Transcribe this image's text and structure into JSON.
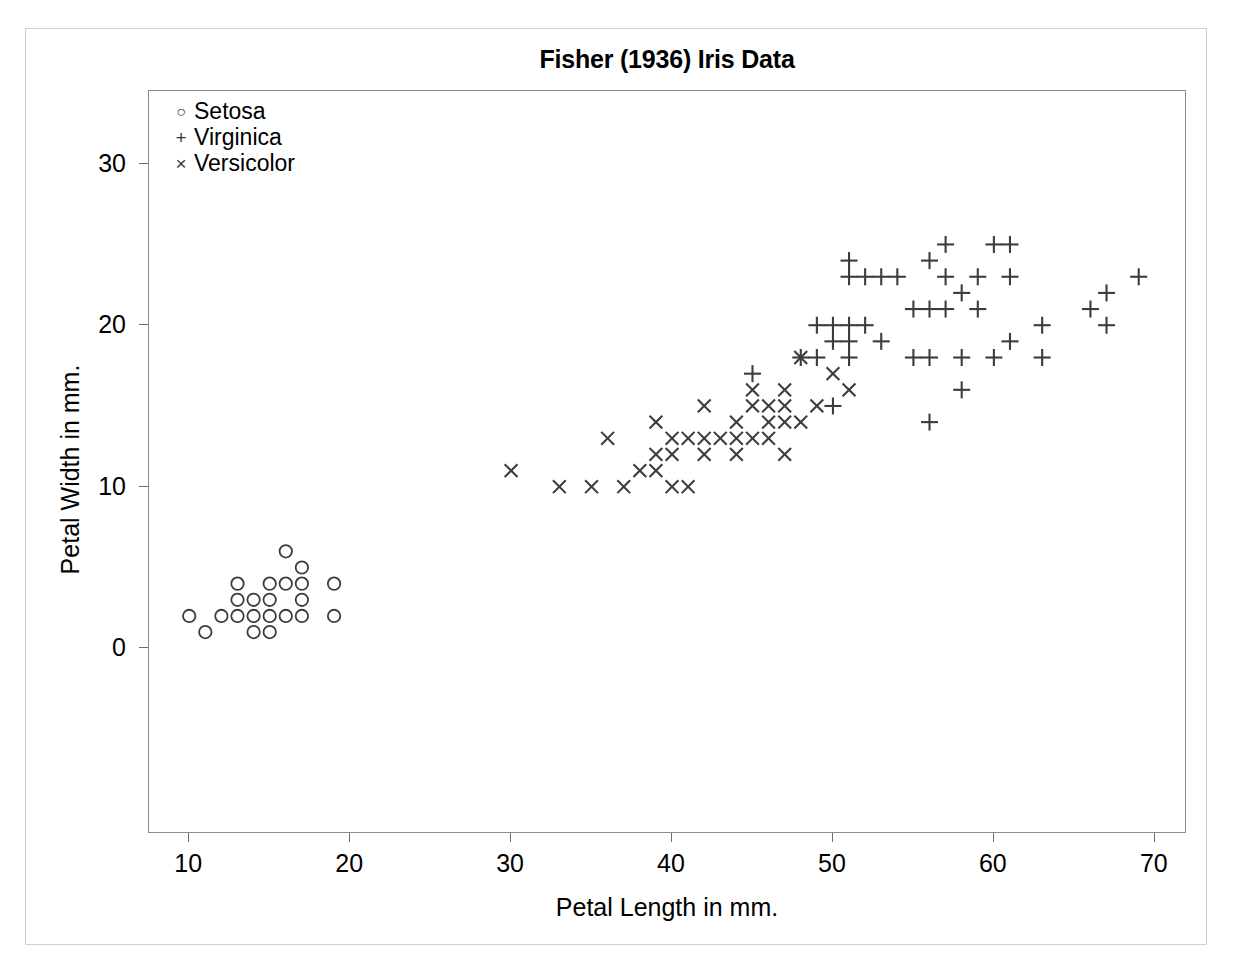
{
  "scan_header_text": "",
  "chart_title": "Fisher (1936) Iris Data",
  "axis": {
    "x_title": "Petal Length in mm.",
    "y_title": "Petal Width in mm.",
    "x_ticks": [
      10,
      20,
      30,
      40,
      50,
      60,
      70
    ],
    "y_ticks": [
      0,
      10,
      20,
      30
    ],
    "x_min": 7.5,
    "x_max": 72.0,
    "y_min": -11.5,
    "y_max": 34.5
  },
  "legend": {
    "position": "top-left",
    "entries": [
      {
        "symbol": "circle",
        "glyph": "○",
        "label": "Setosa"
      },
      {
        "symbol": "plus",
        "glyph": "+",
        "label": "Virginica"
      },
      {
        "symbol": "cross",
        "glyph": "×",
        "label": "Versicolor"
      }
    ]
  },
  "colors": {
    "marker": "#3c3c3c",
    "plot_border": "#8c8c8c",
    "outer_border": "#cfcfcf",
    "tick": "#6f6f6f",
    "text": "#000000",
    "background": "#ffffff"
  },
  "chart_data": {
    "type": "scatter",
    "title": "Fisher (1936) Iris Data",
    "xlabel": "Petal Length in mm.",
    "ylabel": "Petal Width in mm.",
    "xlim": [
      7.5,
      72.0
    ],
    "ylim": [
      -11.5,
      34.5
    ],
    "xticks": [
      10,
      20,
      30,
      40,
      50,
      60,
      70
    ],
    "yticks": [
      0,
      10,
      20,
      30
    ],
    "grid": false,
    "legend_position": "upper-left",
    "units": "millimetres",
    "series": [
      {
        "name": "Setosa",
        "marker": "circle",
        "points": [
          [
            14,
            2
          ],
          [
            14,
            2
          ],
          [
            13,
            2
          ],
          [
            15,
            2
          ],
          [
            14,
            2
          ],
          [
            17,
            4
          ],
          [
            14,
            3
          ],
          [
            15,
            2
          ],
          [
            14,
            2
          ],
          [
            15,
            1
          ],
          [
            15,
            2
          ],
          [
            16,
            2
          ],
          [
            14,
            1
          ],
          [
            11,
            1
          ],
          [
            12,
            2
          ],
          [
            15,
            4
          ],
          [
            13,
            4
          ],
          [
            14,
            3
          ],
          [
            17,
            3
          ],
          [
            15,
            3
          ],
          [
            17,
            2
          ],
          [
            15,
            4
          ],
          [
            10,
            2
          ],
          [
            17,
            5
          ],
          [
            19,
            2
          ],
          [
            16,
            2
          ],
          [
            16,
            4
          ],
          [
            15,
            2
          ],
          [
            14,
            2
          ],
          [
            16,
            2
          ],
          [
            16,
            2
          ],
          [
            15,
            4
          ],
          [
            15,
            1
          ],
          [
            14,
            2
          ],
          [
            15,
            2
          ],
          [
            12,
            2
          ],
          [
            13,
            2
          ],
          [
            14,
            1
          ],
          [
            13,
            2
          ],
          [
            15,
            2
          ],
          [
            13,
            3
          ],
          [
            13,
            3
          ],
          [
            13,
            2
          ],
          [
            16,
            6
          ],
          [
            19,
            4
          ],
          [
            14,
            3
          ],
          [
            16,
            2
          ],
          [
            14,
            2
          ],
          [
            15,
            2
          ],
          [
            14,
            2
          ]
        ]
      },
      {
        "name": "Versicolor",
        "marker": "cross",
        "points": [
          [
            47,
            14
          ],
          [
            45,
            15
          ],
          [
            49,
            15
          ],
          [
            40,
            13
          ],
          [
            46,
            15
          ],
          [
            45,
            13
          ],
          [
            47,
            16
          ],
          [
            33,
            10
          ],
          [
            46,
            13
          ],
          [
            39,
            14
          ],
          [
            35,
            10
          ],
          [
            42,
            15
          ],
          [
            40,
            10
          ],
          [
            47,
            14
          ],
          [
            36,
            13
          ],
          [
            44,
            14
          ],
          [
            45,
            15
          ],
          [
            41,
            10
          ],
          [
            45,
            15
          ],
          [
            39,
            11
          ],
          [
            48,
            18
          ],
          [
            40,
            13
          ],
          [
            49,
            15
          ],
          [
            47,
            12
          ],
          [
            43,
            13
          ],
          [
            44,
            14
          ],
          [
            48,
            14
          ],
          [
            50,
            17
          ],
          [
            45,
            15
          ],
          [
            35,
            10
          ],
          [
            38,
            11
          ],
          [
            37,
            10
          ],
          [
            39,
            12
          ],
          [
            51,
            16
          ],
          [
            45,
            15
          ],
          [
            45,
            16
          ],
          [
            47,
            15
          ],
          [
            44,
            13
          ],
          [
            41,
            13
          ],
          [
            40,
            13
          ],
          [
            44,
            12
          ],
          [
            46,
            14
          ],
          [
            40,
            12
          ],
          [
            33,
            10
          ],
          [
            42,
            13
          ],
          [
            42,
            12
          ],
          [
            42,
            13
          ],
          [
            43,
            13
          ],
          [
            30,
            11
          ],
          [
            41,
            13
          ]
        ]
      },
      {
        "name": "Virginica",
        "marker": "plus",
        "points": [
          [
            60,
            25
          ],
          [
            51,
            19
          ],
          [
            59,
            21
          ],
          [
            56,
            18
          ],
          [
            58,
            22
          ],
          [
            66,
            21
          ],
          [
            45,
            17
          ],
          [
            63,
            18
          ],
          [
            58,
            18
          ],
          [
            61,
            25
          ],
          [
            51,
            20
          ],
          [
            53,
            19
          ],
          [
            55,
            21
          ],
          [
            50,
            20
          ],
          [
            51,
            24
          ],
          [
            53,
            23
          ],
          [
            55,
            18
          ],
          [
            67,
            22
          ],
          [
            69,
            23
          ],
          [
            50,
            15
          ],
          [
            57,
            23
          ],
          [
            49,
            20
          ],
          [
            67,
            20
          ],
          [
            49,
            18
          ],
          [
            57,
            21
          ],
          [
            60,
            18
          ],
          [
            48,
            18
          ],
          [
            49,
            18
          ],
          [
            56,
            21
          ],
          [
            58,
            16
          ],
          [
            61,
            19
          ],
          [
            63,
            20
          ],
          [
            56,
            14
          ],
          [
            58,
            16
          ],
          [
            61,
            23
          ],
          [
            56,
            24
          ],
          [
            51,
            23
          ],
          [
            59,
            23
          ],
          [
            57,
            25
          ],
          [
            52,
            23
          ],
          [
            50,
            19
          ],
          [
            52,
            20
          ],
          [
            54,
            23
          ],
          [
            51,
            18
          ],
          [
            51,
            20
          ],
          [
            52,
            23
          ],
          [
            54,
            23
          ],
          [
            51,
            19
          ],
          [
            51,
            20
          ],
          [
            51,
            18
          ]
        ]
      }
    ]
  }
}
